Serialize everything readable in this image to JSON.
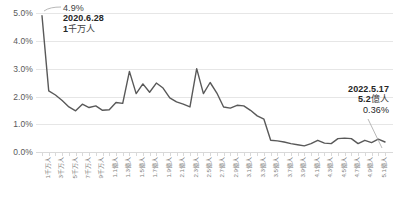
{
  "chart_data": {
    "type": "line",
    "title": "",
    "xlabel": "",
    "ylabel": "",
    "ylim": [
      0,
      5.5
    ],
    "grid": true,
    "legend": "none",
    "y_ticks": [
      "0.0%",
      "1.0%",
      "2.0%",
      "3.0%",
      "4.0%",
      "5.0%"
    ],
    "y_tick_values": [
      0.0,
      1.0,
      2.0,
      3.0,
      4.0,
      5.0
    ],
    "categories": [
      "1千万人",
      "2千万人",
      "3千万人",
      "4千万人",
      "5千万人",
      "6千万人",
      "7千万人",
      "8千万人",
      "9千万人",
      "1.0億人",
      "1.1億人",
      "1.2億人",
      "1.3億人",
      "1.4億人",
      "1.5億人",
      "1.6億人",
      "1.7億人",
      "1.8億人",
      "1.9億人",
      "2.0億人",
      "2.1億人",
      "2.2億人",
      "2.3億人",
      "2.4億人",
      "2.5億人",
      "2.6億人",
      "2.7億人",
      "2.8億人",
      "2.9億人",
      "3.0億人",
      "3.1億人",
      "3.2億人",
      "3.3億人",
      "3.4億人",
      "3.5億人",
      "3.6億人",
      "3.7億人",
      "3.8億人",
      "3.9億人",
      "4.0億人",
      "4.1億人",
      "4.2億人",
      "4.3億人",
      "4.4億人",
      "4.5億人",
      "4.6億人",
      "4.7億人",
      "4.8億人",
      "4.9億人",
      "5.0億人",
      "5.1億人",
      "5.2億人"
    ],
    "visible_x_tick_labels": [
      "1千万人",
      "3千万人",
      "5千万人",
      "7千万人",
      "9千万人",
      "1.1億人",
      "1.3億人",
      "1.5億人",
      "1.7億人",
      "1.9億人",
      "2.1億人",
      "2.3億人",
      "2.5億人",
      "2.7億人",
      "2.9億人",
      "3.1億人",
      "3.3億人",
      "3.5億人",
      "3.7億人",
      "3.9億人",
      "4.1億人",
      "4.3億人",
      "4.5億人",
      "4.7億人",
      "4.9億人",
      "5.1億人"
    ],
    "values": [
      4.9,
      2.2,
      2.05,
      1.85,
      1.62,
      1.48,
      1.72,
      1.6,
      1.66,
      1.5,
      1.52,
      1.78,
      1.75,
      2.9,
      2.1,
      2.45,
      2.15,
      2.48,
      2.3,
      1.95,
      1.8,
      1.72,
      1.62,
      3.0,
      2.1,
      2.5,
      2.12,
      1.62,
      1.58,
      1.68,
      1.66,
      1.5,
      1.3,
      1.18,
      0.42,
      0.4,
      0.36,
      0.3,
      0.26,
      0.22,
      0.3,
      0.42,
      0.32,
      0.3,
      0.48,
      0.5,
      0.48,
      0.3,
      0.42,
      0.34,
      0.46,
      0.36
    ],
    "annotations": [
      {
        "id": "start-point",
        "position": "top-left",
        "percent": "4.9%",
        "date": "2020.6.28",
        "population": "1千万人",
        "population_number": "1",
        "population_unit": "千万人"
      },
      {
        "id": "end-point",
        "position": "right",
        "date": "2022.5.17",
        "population": "5.2億人",
        "population_number": "5.2",
        "population_unit": "億人",
        "percent": "0.36%"
      }
    ],
    "colors": {
      "line": "#595959",
      "grid": "#e6e6e6",
      "baseline": "#d9d9d9",
      "tick_label": "#7f7f7f",
      "y_label": "#595959",
      "annotation_text": "#262626",
      "leader": "#a6a6a6"
    }
  }
}
